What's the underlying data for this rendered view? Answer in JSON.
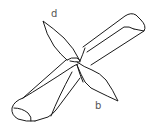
{
  "figure": {
    "stroke_color": "#1a1a1a",
    "background": "#ffffff",
    "labels": {
      "top_tail": "d",
      "bottom_tail": "b"
    }
  }
}
